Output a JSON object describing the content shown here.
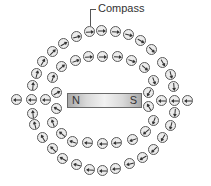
{
  "diagram": {
    "label": "Compass",
    "magnet": {
      "north_label": "N",
      "south_label": "S"
    },
    "colors": {
      "compass_border": "#5a5a5a",
      "compass_fill": "#ececec",
      "needle": "#333333",
      "magnet_edge": "#a9a9a9",
      "magnet_center": "#f2f2f2"
    },
    "compasses": [
      {
        "x": 90,
        "y": 32,
        "a": -5
      },
      {
        "x": 102,
        "y": 31,
        "a": 0
      },
      {
        "x": 116,
        "y": 32,
        "a": 5
      },
      {
        "x": 129,
        "y": 35,
        "a": 15
      },
      {
        "x": 141,
        "y": 41,
        "a": 30
      },
      {
        "x": 152,
        "y": 50,
        "a": 45
      },
      {
        "x": 163,
        "y": 63,
        "a": 60
      },
      {
        "x": 171,
        "y": 75,
        "a": 75
      },
      {
        "x": 174,
        "y": 87,
        "a": 85
      },
      {
        "x": 175,
        "y": 113,
        "a": 95
      },
      {
        "x": 171,
        "y": 126,
        "a": 105
      },
      {
        "x": 163,
        "y": 138,
        "a": 120
      },
      {
        "x": 154,
        "y": 150,
        "a": 135
      },
      {
        "x": 143,
        "y": 158,
        "a": 150
      },
      {
        "x": 130,
        "y": 164,
        "a": 165
      },
      {
        "x": 116,
        "y": 169,
        "a": 175
      },
      {
        "x": 103,
        "y": 171,
        "a": 180
      },
      {
        "x": 90,
        "y": 170,
        "a": 185
      },
      {
        "x": 77,
        "y": 165,
        "a": 195
      },
      {
        "x": 63,
        "y": 159,
        "a": 210
      },
      {
        "x": 53,
        "y": 149,
        "a": 225
      },
      {
        "x": 43,
        "y": 138,
        "a": 240
      },
      {
        "x": 35,
        "y": 125,
        "a": 255
      },
      {
        "x": 33,
        "y": 114,
        "a": 265
      },
      {
        "x": 33,
        "y": 86,
        "a": 275
      },
      {
        "x": 37,
        "y": 74,
        "a": 285
      },
      {
        "x": 43,
        "y": 62,
        "a": 300
      },
      {
        "x": 53,
        "y": 52,
        "a": 315
      },
      {
        "x": 64,
        "y": 44,
        "a": 330
      },
      {
        "x": 77,
        "y": 37,
        "a": 345
      },
      {
        "x": 17,
        "y": 100,
        "a": 180
      },
      {
        "x": 32,
        "y": 100,
        "a": 180
      },
      {
        "x": 46,
        "y": 100,
        "a": 180
      },
      {
        "x": 162,
        "y": 101,
        "a": 180
      },
      {
        "x": 175,
        "y": 101,
        "a": 180
      },
      {
        "x": 188,
        "y": 101,
        "a": 180
      },
      {
        "x": 76,
        "y": 61,
        "a": -20
      },
      {
        "x": 89,
        "y": 57,
        "a": -5
      },
      {
        "x": 103,
        "y": 57,
        "a": 0
      },
      {
        "x": 118,
        "y": 57,
        "a": 5
      },
      {
        "x": 132,
        "y": 61,
        "a": 20
      },
      {
        "x": 145,
        "y": 68,
        "a": 40
      },
      {
        "x": 154,
        "y": 81,
        "a": 70
      },
      {
        "x": 149,
        "y": 93,
        "a": 120
      },
      {
        "x": 149,
        "y": 107,
        "a": 240
      },
      {
        "x": 154,
        "y": 121,
        "a": 110
      },
      {
        "x": 146,
        "y": 132,
        "a": 140
      },
      {
        "x": 133,
        "y": 140,
        "a": 160
      },
      {
        "x": 117,
        "y": 143,
        "a": 175
      },
      {
        "x": 103,
        "y": 144,
        "a": 180
      },
      {
        "x": 88,
        "y": 143,
        "a": 185
      },
      {
        "x": 73,
        "y": 142,
        "a": 200
      },
      {
        "x": 62,
        "y": 134,
        "a": 220
      },
      {
        "x": 53,
        "y": 123,
        "a": 250
      },
      {
        "x": 57,
        "y": 109,
        "a": 210
      },
      {
        "x": 57,
        "y": 93,
        "a": 330
      },
      {
        "x": 53,
        "y": 78,
        "a": 290
      },
      {
        "x": 62,
        "y": 67,
        "a": 320
      }
    ]
  }
}
